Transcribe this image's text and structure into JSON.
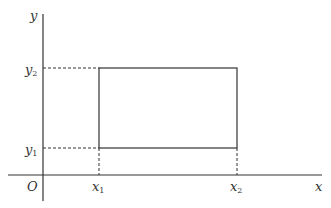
{
  "diagram": {
    "axes": {
      "x_label": "x",
      "y_label": "y",
      "origin_label": "O"
    },
    "rectangle": {
      "x1_label": "x",
      "x1_sub": "1",
      "x2_label": "x",
      "x2_sub": "2",
      "y1_label": "y",
      "y1_sub": "1",
      "y2_label": "y",
      "y2_sub": "2"
    },
    "colors": {
      "line": "#333333",
      "background": "#ffffff"
    }
  }
}
